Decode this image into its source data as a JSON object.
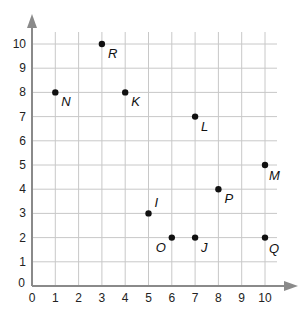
{
  "chart_data": {
    "type": "scatter",
    "title": "",
    "xlabel": "",
    "ylabel": "",
    "xlim": [
      0,
      10
    ],
    "ylim": [
      0,
      10
    ],
    "grid": true,
    "x_ticks": [
      0,
      1,
      2,
      3,
      4,
      5,
      6,
      7,
      8,
      9,
      10
    ],
    "y_ticks": [
      0,
      1,
      2,
      3,
      4,
      5,
      6,
      7,
      8,
      9,
      10
    ],
    "points": [
      {
        "label": "R",
        "x": 3,
        "y": 10
      },
      {
        "label": "N",
        "x": 1,
        "y": 8
      },
      {
        "label": "K",
        "x": 4,
        "y": 8
      },
      {
        "label": "L",
        "x": 7,
        "y": 7
      },
      {
        "label": "M",
        "x": 10,
        "y": 5
      },
      {
        "label": "P",
        "x": 8,
        "y": 4
      },
      {
        "label": "I",
        "x": 5,
        "y": 3
      },
      {
        "label": "O",
        "x": 6,
        "y": 2
      },
      {
        "label": "J",
        "x": 7,
        "y": 2
      },
      {
        "label": "Q",
        "x": 10,
        "y": 2
      }
    ],
    "label_offsets": {
      "R": [
        6,
        14
      ],
      "N": [
        6,
        14
      ],
      "K": [
        6,
        14
      ],
      "L": [
        6,
        14
      ],
      "M": [
        4,
        15
      ],
      "P": [
        6,
        14
      ],
      "I": [
        6,
        -6
      ],
      "O": [
        -16,
        14
      ],
      "J": [
        6,
        14
      ],
      "Q": [
        4,
        15
      ]
    }
  },
  "colors": {
    "grid": "#c8c8c8",
    "axis": "#8a8a8a",
    "point": "#111111"
  }
}
